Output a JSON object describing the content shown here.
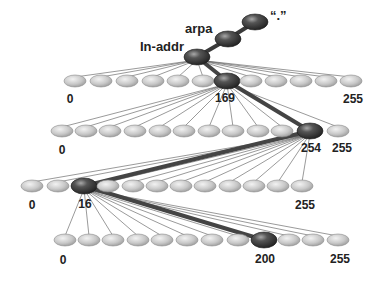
{
  "colors": {
    "background": "#ffffff",
    "node_light": "#c8c8c8",
    "node_light_edge": "#8a8a8a",
    "node_dark": "#3c3c3c",
    "node_dark_highlight": "#8a8a8a",
    "thin_line": "#555555",
    "thick_line": "#444444",
    "label": "#222222"
  },
  "labels": {
    "root": "“.”",
    "arpa": "arpa",
    "in_addr": "In-addr"
  },
  "chain": [
    {
      "name": "root",
      "x": 255,
      "y": 22
    },
    {
      "name": "arpa",
      "x": 228,
      "y": 39
    },
    {
      "name": "in-addr",
      "x": 197,
      "y": 57
    }
  ],
  "rows": [
    {
      "y": 81,
      "parent": {
        "x": 197,
        "y": 57
      },
      "highlight_index": 6,
      "nodes_x": [
        75,
        101,
        127,
        153,
        178,
        203,
        227,
        251,
        276,
        301,
        326,
        351
      ],
      "labels": [
        {
          "text": "0",
          "x": 70,
          "y": 103
        },
        {
          "text": "169",
          "x": 225,
          "y": 102
        },
        {
          "text": "255",
          "x": 353,
          "y": 103
        }
      ]
    },
    {
      "y": 131,
      "parent": {
        "x": 227,
        "y": 81
      },
      "highlight_index": 11,
      "nodes_x": [
        62,
        86,
        110,
        135,
        160,
        184,
        209,
        233,
        258,
        282,
        286,
        310,
        338
      ],
      "labels": [
        {
          "text": "0",
          "x": 62,
          "y": 154
        },
        {
          "text": "254",
          "x": 311,
          "y": 152
        },
        {
          "text": "255",
          "x": 342,
          "y": 152
        }
      ]
    },
    {
      "y": 186,
      "parent": {
        "x": 310,
        "y": 131
      },
      "highlight_index": 2,
      "nodes_x": [
        32,
        58,
        84,
        108,
        133,
        157,
        181,
        205,
        230,
        254,
        278,
        302
      ],
      "labels": [
        {
          "text": "0",
          "x": 32,
          "y": 209
        },
        {
          "text": "16",
          "x": 85,
          "y": 208
        },
        {
          "text": "255",
          "x": 305,
          "y": 209
        }
      ]
    },
    {
      "y": 240,
      "parent": {
        "x": 84,
        "y": 186
      },
      "highlight_index": 8,
      "nodes_x": [
        65,
        89,
        113,
        138,
        162,
        187,
        212,
        238,
        264,
        289,
        313,
        338
      ],
      "labels": [
        {
          "text": "0",
          "x": 63,
          "y": 264
        },
        {
          "text": "200",
          "x": 265,
          "y": 263
        },
        {
          "text": "255",
          "x": 340,
          "y": 263
        }
      ]
    }
  ]
}
